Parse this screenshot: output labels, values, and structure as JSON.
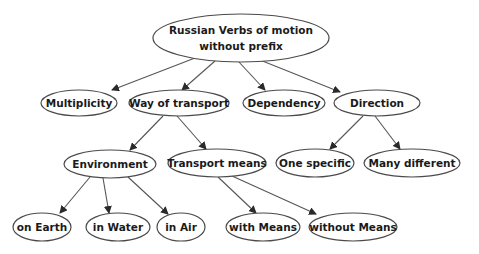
{
  "diagram": {
    "colors": {
      "background": "#ffffff",
      "node_stroke": "#4a4a4a",
      "node_fill": "#ffffff",
      "edge": "#555555",
      "text": "#1a1a1a"
    },
    "nodes": [
      {
        "id": "root",
        "lines": [
          "Russian Verbs of motion",
          "without prefix"
        ],
        "cx": 241,
        "cy": 38,
        "rx": 88,
        "ry": 24
      },
      {
        "id": "multiplicity",
        "lines": [
          "Multiplicity"
        ],
        "cx": 79,
        "cy": 103,
        "rx": 38,
        "ry": 13
      },
      {
        "id": "way-of-transport",
        "lines": [
          "Way of transport"
        ],
        "cx": 179,
        "cy": 103,
        "rx": 50,
        "ry": 13
      },
      {
        "id": "dependency",
        "lines": [
          "Dependency"
        ],
        "cx": 284,
        "cy": 103,
        "rx": 41,
        "ry": 13
      },
      {
        "id": "direction",
        "lines": [
          "Direction"
        ],
        "cx": 377,
        "cy": 103,
        "rx": 43,
        "ry": 13
      },
      {
        "id": "environment",
        "lines": [
          "Environment"
        ],
        "cx": 110,
        "cy": 164,
        "rx": 46,
        "ry": 14
      },
      {
        "id": "transport-means",
        "lines": [
          "Transport means"
        ],
        "cx": 217,
        "cy": 163,
        "rx": 49,
        "ry": 14
      },
      {
        "id": "one-specific",
        "lines": [
          "One specific"
        ],
        "cx": 315,
        "cy": 163,
        "rx": 39,
        "ry": 14
      },
      {
        "id": "many-different",
        "lines": [
          "Many different"
        ],
        "cx": 412,
        "cy": 163,
        "rx": 48,
        "ry": 14
      },
      {
        "id": "on-earth",
        "lines": [
          "on Earth"
        ],
        "cx": 42,
        "cy": 227,
        "rx": 29,
        "ry": 14
      },
      {
        "id": "in-water",
        "lines": [
          "in Water"
        ],
        "cx": 118,
        "cy": 227,
        "rx": 32,
        "ry": 14
      },
      {
        "id": "in-air",
        "lines": [
          "in Air"
        ],
        "cx": 181,
        "cy": 227,
        "rx": 24,
        "ry": 14
      },
      {
        "id": "with-means",
        "lines": [
          "with Means"
        ],
        "cx": 263,
        "cy": 227,
        "rx": 37,
        "ry": 14
      },
      {
        "id": "without-means",
        "lines": [
          "without Means"
        ],
        "cx": 353,
        "cy": 227,
        "rx": 44,
        "ry": 14
      }
    ],
    "edges": [
      {
        "from": "root",
        "to": "multiplicity",
        "x1": 195,
        "y1": 58,
        "x2": 112,
        "y2": 90
      },
      {
        "from": "root",
        "to": "way-of-transport",
        "x1": 215,
        "y1": 61,
        "x2": 182,
        "y2": 90
      },
      {
        "from": "root",
        "to": "dependency",
        "x1": 238,
        "y1": 61,
        "x2": 265,
        "y2": 90
      },
      {
        "from": "root",
        "to": "direction",
        "x1": 260,
        "y1": 60,
        "x2": 340,
        "y2": 92
      },
      {
        "from": "way-of-transport",
        "to": "environment",
        "x1": 163,
        "y1": 116,
        "x2": 130,
        "y2": 150
      },
      {
        "from": "way-of-transport",
        "to": "transport-means",
        "x1": 177,
        "y1": 116,
        "x2": 206,
        "y2": 149
      },
      {
        "from": "direction",
        "to": "one-specific",
        "x1": 363,
        "y1": 116,
        "x2": 330,
        "y2": 149
      },
      {
        "from": "direction",
        "to": "many-different",
        "x1": 375,
        "y1": 116,
        "x2": 400,
        "y2": 149
      },
      {
        "from": "environment",
        "to": "on-earth",
        "x1": 90,
        "y1": 177,
        "x2": 60,
        "y2": 213
      },
      {
        "from": "environment",
        "to": "in-water",
        "x1": 103,
        "y1": 178,
        "x2": 109,
        "y2": 213
      },
      {
        "from": "environment",
        "to": "in-air",
        "x1": 128,
        "y1": 177,
        "x2": 168,
        "y2": 214
      },
      {
        "from": "transport-means",
        "to": "with-means",
        "x1": 218,
        "y1": 177,
        "x2": 256,
        "y2": 213
      },
      {
        "from": "transport-means",
        "to": "without-means",
        "x1": 232,
        "y1": 176,
        "x2": 316,
        "y2": 214
      }
    ]
  }
}
